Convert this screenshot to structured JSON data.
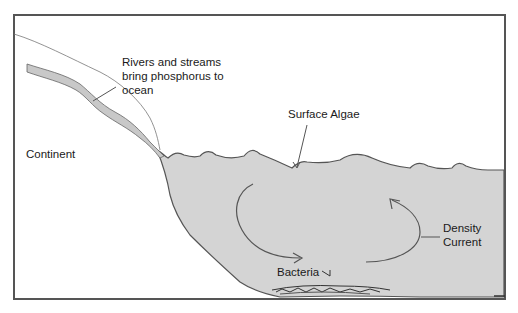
{
  "diagram": {
    "labels": {
      "rivers_line1": "Rivers and streams",
      "rivers_line2": "bring phosphorus to",
      "rivers_line3": "ocean",
      "continent": "Continent",
      "surface_algae": "Surface Algae",
      "density_line1": "Density",
      "density_line2": "Current",
      "bacteria": "Bacteria"
    },
    "colors": {
      "ocean_fill": "#d4d4d4",
      "outline": "#555555",
      "frame": "#555555",
      "river_fill": "#c8c8c8"
    }
  }
}
